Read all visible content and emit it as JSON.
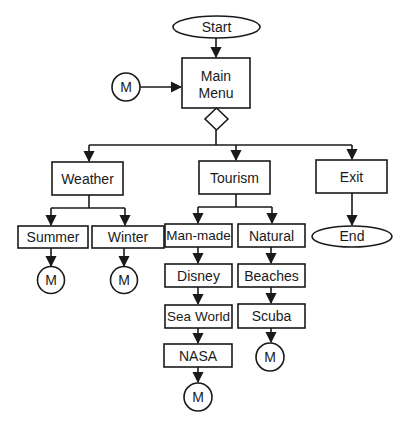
{
  "diagram": {
    "type": "flowchart",
    "colors": {
      "stroke": "#1a1a1a",
      "fill": "#ffffff",
      "background": "#ffffff"
    },
    "nodes": {
      "start": {
        "label": "Start",
        "shape": "terminator"
      },
      "main_menu": {
        "label_line1": "Main",
        "label_line2": "Menu",
        "shape": "process"
      },
      "decision": {
        "label": "",
        "shape": "decision"
      },
      "connector_main": {
        "label": "M",
        "shape": "connector"
      },
      "weather": {
        "label": "Weather",
        "shape": "process"
      },
      "tourism": {
        "label": "Tourism",
        "shape": "process"
      },
      "exit": {
        "label": "Exit",
        "shape": "process"
      },
      "summer": {
        "label": "Summer",
        "shape": "process"
      },
      "winter": {
        "label": "Winter",
        "shape": "process"
      },
      "man_made": {
        "label": "Man-made",
        "shape": "process"
      },
      "natural": {
        "label": "Natural",
        "shape": "process"
      },
      "end": {
        "label": "End",
        "shape": "terminator"
      },
      "disney": {
        "label": "Disney",
        "shape": "process"
      },
      "beaches": {
        "label": "Beaches",
        "shape": "process"
      },
      "sea_world": {
        "label": "Sea World",
        "shape": "process"
      },
      "scuba": {
        "label": "Scuba",
        "shape": "process"
      },
      "nasa": {
        "label": "NASA",
        "shape": "process"
      },
      "connector_summer": {
        "label": "M",
        "shape": "connector"
      },
      "connector_winter": {
        "label": "M",
        "shape": "connector"
      },
      "connector_scuba": {
        "label": "M",
        "shape": "connector"
      },
      "connector_nasa": {
        "label": "M",
        "shape": "connector"
      }
    },
    "edges": [
      [
        "start",
        "main_menu"
      ],
      [
        "connector_main",
        "main_menu"
      ],
      [
        "main_menu",
        "decision"
      ],
      [
        "decision",
        "weather"
      ],
      [
        "decision",
        "tourism"
      ],
      [
        "decision",
        "exit"
      ],
      [
        "weather",
        "summer"
      ],
      [
        "weather",
        "winter"
      ],
      [
        "tourism",
        "man_made"
      ],
      [
        "tourism",
        "natural"
      ],
      [
        "exit",
        "end"
      ],
      [
        "summer",
        "connector_summer"
      ],
      [
        "winter",
        "connector_winter"
      ],
      [
        "man_made",
        "disney"
      ],
      [
        "disney",
        "sea_world"
      ],
      [
        "sea_world",
        "nasa"
      ],
      [
        "nasa",
        "connector_nasa"
      ],
      [
        "natural",
        "beaches"
      ],
      [
        "beaches",
        "scuba"
      ],
      [
        "scuba",
        "connector_scuba"
      ]
    ]
  }
}
